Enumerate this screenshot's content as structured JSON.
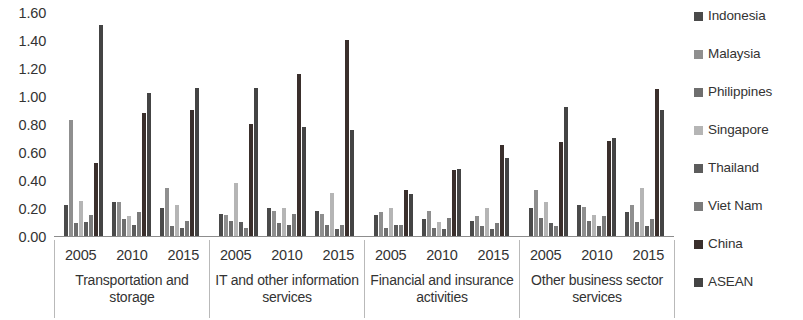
{
  "chart_data": {
    "type": "bar",
    "title": "",
    "subtitle": "",
    "xlabel": "",
    "ylabel": "",
    "ylim": [
      0.0,
      1.6
    ],
    "ytick_labels": [
      "1.60",
      "1.40",
      "1.20",
      "1.00",
      "0.80",
      "0.60",
      "0.40",
      "0.20",
      "0.00"
    ],
    "ytick_values": [
      1.6,
      1.4,
      1.2,
      1.0,
      0.8,
      0.6,
      0.4,
      0.2,
      0.0
    ],
    "grid": false,
    "legend_position": "right",
    "legend_entries": [
      "Indonesia",
      "Malaysia",
      "Philippines",
      "Singapore",
      "Thailand",
      "Viet Nam",
      "China",
      "ASEAN"
    ],
    "series_colors": [
      "#4a4a4a",
      "#8f8f8f",
      "#6e6e6e",
      "#b5b5b5",
      "#5c5c5c",
      "#7b7b7b",
      "#3a2f2c",
      "#444444"
    ],
    "sectors": [
      "Transportation and storage",
      "IT and other information services",
      "Financial and insurance activities",
      "Other business sector services"
    ],
    "years": [
      "2005",
      "2010",
      "2015"
    ],
    "series": [
      {
        "name": "Indonesia",
        "values": [
          [
            0.22,
            0.24,
            0.2
          ],
          [
            0.16,
            0.2,
            0.18
          ],
          [
            0.15,
            0.12,
            0.11
          ],
          [
            0.2,
            0.22,
            0.17
          ]
        ]
      },
      {
        "name": "Malaysia",
        "values": [
          [
            0.83,
            0.24,
            0.34
          ],
          [
            0.15,
            0.18,
            0.16
          ],
          [
            0.17,
            0.18,
            0.14
          ],
          [
            0.33,
            0.21,
            0.22
          ]
        ]
      },
      {
        "name": "Philippines",
        "values": [
          [
            0.09,
            0.12,
            0.07
          ],
          [
            0.11,
            0.09,
            0.08
          ],
          [
            0.06,
            0.06,
            0.07
          ],
          [
            0.13,
            0.11,
            0.1
          ]
        ]
      },
      {
        "name": "Singapore",
        "values": [
          [
            0.25,
            0.14,
            0.22
          ],
          [
            0.38,
            0.2,
            0.31
          ],
          [
            0.2,
            0.1,
            0.2
          ],
          [
            0.24,
            0.15,
            0.34
          ]
        ]
      },
      {
        "name": "Thailand",
        "values": [
          [
            0.1,
            0.08,
            0.06
          ],
          [
            0.1,
            0.08,
            0.05
          ],
          [
            0.08,
            0.05,
            0.05
          ],
          [
            0.09,
            0.07,
            0.07
          ]
        ]
      },
      {
        "name": "Viet Nam",
        "values": [
          [
            0.15,
            0.17,
            0.11
          ],
          [
            0.06,
            0.16,
            0.08
          ],
          [
            0.08,
            0.13,
            0.09
          ],
          [
            0.07,
            0.14,
            0.12
          ]
        ]
      },
      {
        "name": "China",
        "values": [
          [
            0.52,
            0.88,
            0.9
          ],
          [
            0.8,
            1.16,
            1.4
          ],
          [
            0.33,
            0.47,
            0.65
          ],
          [
            0.67,
            0.68,
            1.05
          ]
        ]
      },
      {
        "name": "ASEAN",
        "values": [
          [
            1.51,
            1.02,
            1.06
          ],
          [
            1.06,
            0.78,
            0.76
          ],
          [
            0.3,
            0.48,
            0.56
          ],
          [
            0.92,
            0.7,
            0.9
          ]
        ]
      }
    ]
  }
}
